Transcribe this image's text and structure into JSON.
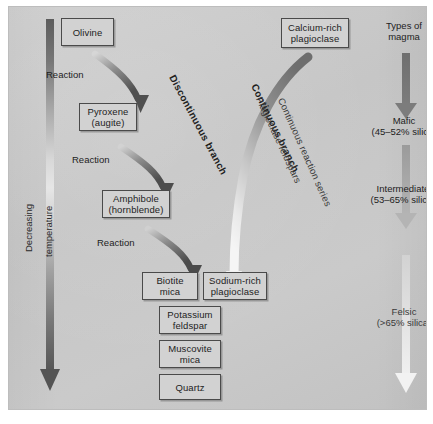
{
  "diagram": {
    "left_axis": {
      "line1": "Decreasing",
      "line2": "temperature"
    },
    "discontinuous_branch": {
      "label": "Discontinuous branch",
      "reaction_labels": [
        "Reaction",
        "Reaction",
        "Reaction"
      ],
      "minerals": [
        {
          "line1": "Olivine",
          "line2": ""
        },
        {
          "line1": "Pyroxene",
          "line2": "(augite)"
        },
        {
          "line1": "Amphibole",
          "line2": "(hornblende)"
        },
        {
          "line1": "Biotite",
          "line2": "mica"
        }
      ]
    },
    "continuous_branch": {
      "label": "Continuous branch",
      "sublabel1": "Plagioclase feldspars",
      "sublabel2": "Continuous reaction series",
      "minerals": [
        {
          "line1": "Calcium-rich",
          "line2": "plagioclase"
        },
        {
          "line1": "Sodium-rich",
          "line2": "plagioclase"
        }
      ]
    },
    "late_minerals": [
      {
        "line1": "Potassium",
        "line2": "feldspar"
      },
      {
        "line1": "Muscovite",
        "line2": "mica"
      },
      {
        "line1": "Quartz",
        "line2": ""
      }
    ],
    "magma_column": {
      "heading_line1": "Types of",
      "heading_line2": "magma",
      "types": [
        {
          "name": "Mafic",
          "silica": "(45–52% silica)"
        },
        {
          "name": "Intermediate",
          "silica": "(53–65% silica)"
        },
        {
          "name": "Felsic",
          "silica": "(>65% silica)"
        }
      ]
    },
    "colors": {
      "panel_background": "#c9c9c9",
      "box_fill": "#d2d2d2",
      "box_border": "#4a4a4a",
      "arrow_dark": "#6b6b6b",
      "arrow_light": "#efefef",
      "text": "#1d1d1d"
    }
  }
}
